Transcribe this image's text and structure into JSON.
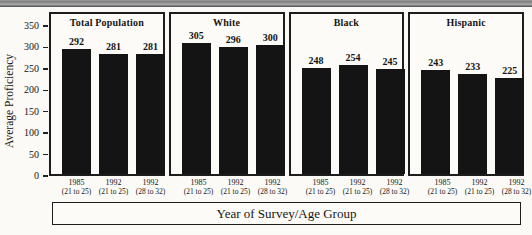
{
  "figure": {
    "y_axis_title": "Average Proficiency",
    "x_axis_title": "Year of Survey/Age Group"
  },
  "chart_data": {
    "type": "bar",
    "title": "",
    "ylabel": "Average Proficiency",
    "xlabel": "Year of Survey/Age Group",
    "ylim": [
      0,
      350
    ],
    "yticks": [
      0,
      50,
      100,
      150,
      200,
      250,
      300,
      350
    ],
    "grid": false,
    "legend_position": "none",
    "bar_color": "#141414",
    "categories": [
      "1985 (21 to 25)",
      "1992 (21 to 25)",
      "1992 (28 to 32)"
    ],
    "category_lines": [
      [
        "1985",
        "(21 to 25)"
      ],
      [
        "1992",
        "(21 to 25)"
      ],
      [
        "1992",
        "(28 to 32)"
      ]
    ],
    "series": [
      {
        "name": "Total Population",
        "values": [
          292,
          281,
          281
        ]
      },
      {
        "name": "White",
        "values": [
          305,
          296,
          300
        ]
      },
      {
        "name": "Black",
        "values": [
          248,
          254,
          245
        ]
      },
      {
        "name": "Hispanic",
        "values": [
          243,
          233,
          225
        ]
      }
    ]
  }
}
